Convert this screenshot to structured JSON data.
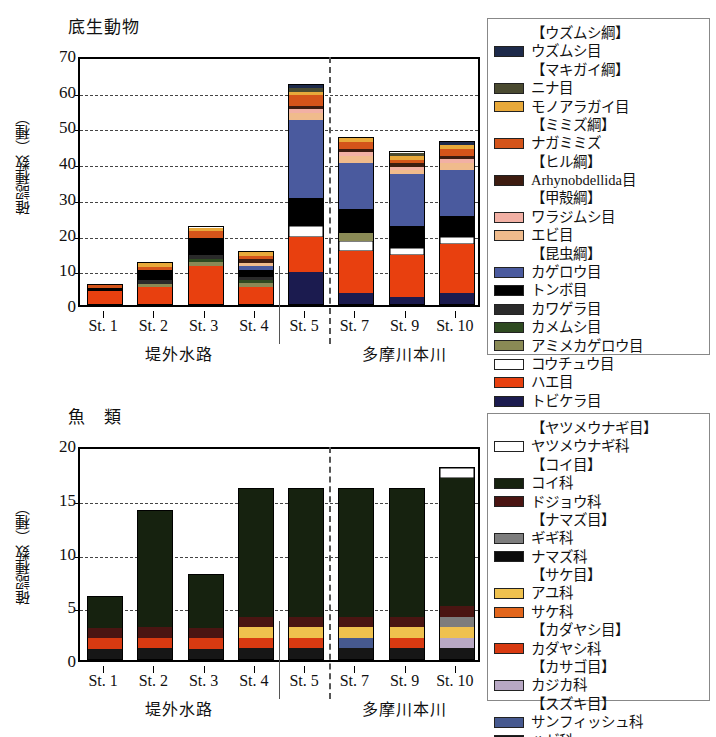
{
  "chart_data": [
    {
      "type": "bar",
      "id": "benthic",
      "title": "底生動物",
      "ylabel": "確認種数（種）",
      "xlabel": "",
      "ylim": [
        0,
        70
      ],
      "yticks": [
        0,
        10,
        20,
        30,
        40,
        50,
        60,
        70
      ],
      "grid": true,
      "stacked": true,
      "legend_position": "right",
      "categories": [
        "St. 1",
        "St. 2",
        "St. 3",
        "St. 4",
        "St. 5",
        "St. 7",
        "St. 9",
        "St. 10"
      ],
      "group_labels": [
        "堤外水路",
        "多摩川本川"
      ],
      "totals": [
        6,
        12,
        22,
        15,
        62,
        47,
        43,
        46
      ],
      "series": [
        {
          "name": "トビケラ目",
          "color": "#1b1b4f",
          "values": [
            0,
            0,
            0,
            0,
            9,
            3,
            2,
            3
          ]
        },
        {
          "name": "ハエ目",
          "color": "#e8400f",
          "values": [
            4,
            5,
            11,
            5,
            10,
            12,
            12,
            14
          ]
        },
        {
          "name": "コウチュウ目",
          "color": "#ffffff",
          "values": [
            0,
            0,
            0,
            0,
            3,
            3,
            2,
            2
          ]
        },
        {
          "name": "アミメカゲロウ目",
          "color": "#8a8a55",
          "values": [
            0,
            1,
            1,
            1,
            0,
            2,
            0,
            0
          ]
        },
        {
          "name": "カメムシ目",
          "color": "#2e4a20",
          "values": [
            0,
            0,
            1,
            1,
            0,
            0,
            0,
            0
          ]
        },
        {
          "name": "カワゲラ目",
          "color": "#2a2a2a",
          "values": [
            0,
            1,
            1,
            1,
            0,
            0,
            0,
            0
          ]
        },
        {
          "name": "トンボ目",
          "color": "#000000",
          "values": [
            1,
            3,
            5,
            2,
            8,
            7,
            6,
            6
          ]
        },
        {
          "name": "カゲロウ目",
          "color": "#4a5a9e",
          "values": [
            0,
            0,
            0,
            1,
            22,
            13,
            15,
            13
          ]
        },
        {
          "name": "エビ目",
          "color": "#f0bb8c",
          "values": [
            0,
            0,
            0,
            1,
            2,
            2,
            1,
            2
          ]
        },
        {
          "name": "ワラジムシ目",
          "color": "#f2b0a4",
          "values": [
            0,
            0,
            0,
            0,
            1,
            1,
            1,
            1
          ]
        },
        {
          "name": "Arhynobdellida目",
          "color": "#3d1c10",
          "values": [
            0,
            0,
            0,
            1,
            1,
            1,
            1,
            1
          ]
        },
        {
          "name": "ナガミミズ",
          "color": "#d4541a",
          "values": [
            1,
            1,
            2,
            1,
            3,
            2,
            1,
            2
          ]
        },
        {
          "name": "モノアラガイ目",
          "color": "#e8a93a",
          "values": [
            0,
            1,
            1,
            1,
            1,
            1,
            1,
            1
          ]
        },
        {
          "name": "ニナ目",
          "color": "#4a4a30",
          "values": [
            0,
            0,
            0,
            0,
            1,
            0,
            1,
            0
          ]
        },
        {
          "name": "ウズムシ目",
          "color": "#1d2a4a",
          "values": [
            0,
            0,
            0,
            0,
            1,
            0,
            0,
            1
          ]
        }
      ]
    },
    {
      "type": "bar",
      "id": "fish",
      "title": "魚　類",
      "ylabel": "確認種数（種）",
      "xlabel": "",
      "ylim": [
        0,
        20
      ],
      "yticks": [
        0,
        5,
        10,
        15,
        20
      ],
      "grid": true,
      "stacked": true,
      "legend_position": "right",
      "categories": [
        "St. 1",
        "St. 2",
        "St. 3",
        "St. 4",
        "St. 5",
        "St. 7",
        "St. 9",
        "St. 10"
      ],
      "group_labels": [
        "堤外水路",
        "多摩川本川"
      ],
      "totals": [
        6,
        14,
        8,
        16,
        16,
        16,
        16,
        18
      ],
      "series": [
        {
          "name": "ハゼ科",
          "color": "#161616",
          "values": [
            1,
            1,
            1,
            1,
            1,
            1,
            1,
            1
          ]
        },
        {
          "name": "サンフィッシュ科",
          "color": "#46598f",
          "values": [
            0,
            0,
            0,
            0,
            0,
            1,
            0,
            0
          ]
        },
        {
          "name": "カジカ科",
          "color": "#b8a8c4",
          "values": [
            0,
            0,
            0,
            0,
            0,
            0,
            0,
            1
          ]
        },
        {
          "name": "カダヤシ科",
          "color": "#d83a11",
          "values": [
            1,
            1,
            1,
            1,
            1,
            0,
            1,
            0
          ]
        },
        {
          "name": "サケ科",
          "color": "#e2661c",
          "values": [
            0,
            0,
            0,
            0,
            0,
            0,
            0,
            0
          ]
        },
        {
          "name": "アユ科",
          "color": "#efc14e",
          "values": [
            0,
            0,
            0,
            1,
            1,
            1,
            1,
            1
          ]
        },
        {
          "name": "ナマズ科",
          "color": "#0b0b0b",
          "values": [
            0,
            0,
            0,
            0,
            0,
            0,
            0,
            0
          ]
        },
        {
          "name": "ギギ科",
          "color": "#7d7d7d",
          "values": [
            0,
            0,
            0,
            0,
            0,
            0,
            0,
            1
          ]
        },
        {
          "name": "ドジョウ科",
          "color": "#4a1512",
          "values": [
            1,
            1,
            1,
            1,
            1,
            1,
            1,
            1
          ]
        },
        {
          "name": "コイ科",
          "color": "#16220f",
          "values": [
            3,
            11,
            5,
            12,
            12,
            12,
            12,
            12
          ]
        },
        {
          "name": "ヤツメウナギ科",
          "color": "#ffffff",
          "values": [
            0,
            0,
            0,
            0,
            0,
            0,
            0,
            1
          ]
        }
      ]
    }
  ],
  "benthic_legend": [
    {
      "text": "【ウズムシ綱】",
      "header": true,
      "color": null
    },
    {
      "text": "ウズムシ目",
      "header": false,
      "color": "#1d2a4a"
    },
    {
      "text": "【マキガイ綱】",
      "header": true,
      "color": null
    },
    {
      "text": "ニナ目",
      "header": false,
      "color": "#4a4a30"
    },
    {
      "text": "モノアラガイ目",
      "header": false,
      "color": "#e8a93a"
    },
    {
      "text": "【ミミズ綱】",
      "header": true,
      "color": null
    },
    {
      "text": "ナガミミズ",
      "header": false,
      "color": "#d4541a"
    },
    {
      "text": "【ヒル綱】",
      "header": true,
      "color": null
    },
    {
      "text": "Arhynobdellida目",
      "header": false,
      "color": "#3d1c10"
    },
    {
      "text": "【甲殻綱】",
      "header": true,
      "color": null
    },
    {
      "text": "ワラジムシ目",
      "header": false,
      "color": "#f2b0a4"
    },
    {
      "text": "エビ目",
      "header": false,
      "color": "#f0bb8c"
    },
    {
      "text": "【昆虫綱】",
      "header": true,
      "color": null
    },
    {
      "text": "カゲロウ目",
      "header": false,
      "color": "#4a5a9e"
    },
    {
      "text": "トンボ目",
      "header": false,
      "color": "#000000"
    },
    {
      "text": "カワゲラ目",
      "header": false,
      "color": "#2a2a2a"
    },
    {
      "text": "カメムシ目",
      "header": false,
      "color": "#2e4a20"
    },
    {
      "text": "アミメカゲロウ目",
      "header": false,
      "color": "#8a8a55"
    },
    {
      "text": "コウチュウ目",
      "header": false,
      "color": "#ffffff"
    },
    {
      "text": "ハエ目",
      "header": false,
      "color": "#e8400f"
    },
    {
      "text": "トビケラ目",
      "header": false,
      "color": "#1b1b4f"
    }
  ],
  "fish_legend": [
    {
      "text": "【ヤツメウナギ目】",
      "header": true,
      "color": null
    },
    {
      "text": "ヤツメウナギ科",
      "header": false,
      "color": "#ffffff"
    },
    {
      "text": "【コイ目】",
      "header": true,
      "color": null
    },
    {
      "text": "コイ科",
      "header": false,
      "color": "#16220f"
    },
    {
      "text": "ドジョウ科",
      "header": false,
      "color": "#4a1512"
    },
    {
      "text": "【ナマズ目】",
      "header": true,
      "color": null
    },
    {
      "text": "ギギ科",
      "header": false,
      "color": "#7d7d7d"
    },
    {
      "text": "ナマズ科",
      "header": false,
      "color": "#0b0b0b"
    },
    {
      "text": "【サケ目】",
      "header": true,
      "color": null
    },
    {
      "text": "アユ科",
      "header": false,
      "color": "#efc14e"
    },
    {
      "text": "サケ科",
      "header": false,
      "color": "#e2661c"
    },
    {
      "text": "【カダヤシ目】",
      "header": true,
      "color": null
    },
    {
      "text": "カダヤシ科",
      "header": false,
      "color": "#d83a11"
    },
    {
      "text": "【カサゴ目】",
      "header": true,
      "color": null
    },
    {
      "text": "カジカ科",
      "header": false,
      "color": "#b8a8c4"
    },
    {
      "text": "【スズキ目】",
      "header": true,
      "color": null
    },
    {
      "text": "サンフィッシュ科",
      "header": false,
      "color": "#46598f"
    },
    {
      "text": "ハゼ科",
      "header": false,
      "color": "#161616"
    }
  ]
}
